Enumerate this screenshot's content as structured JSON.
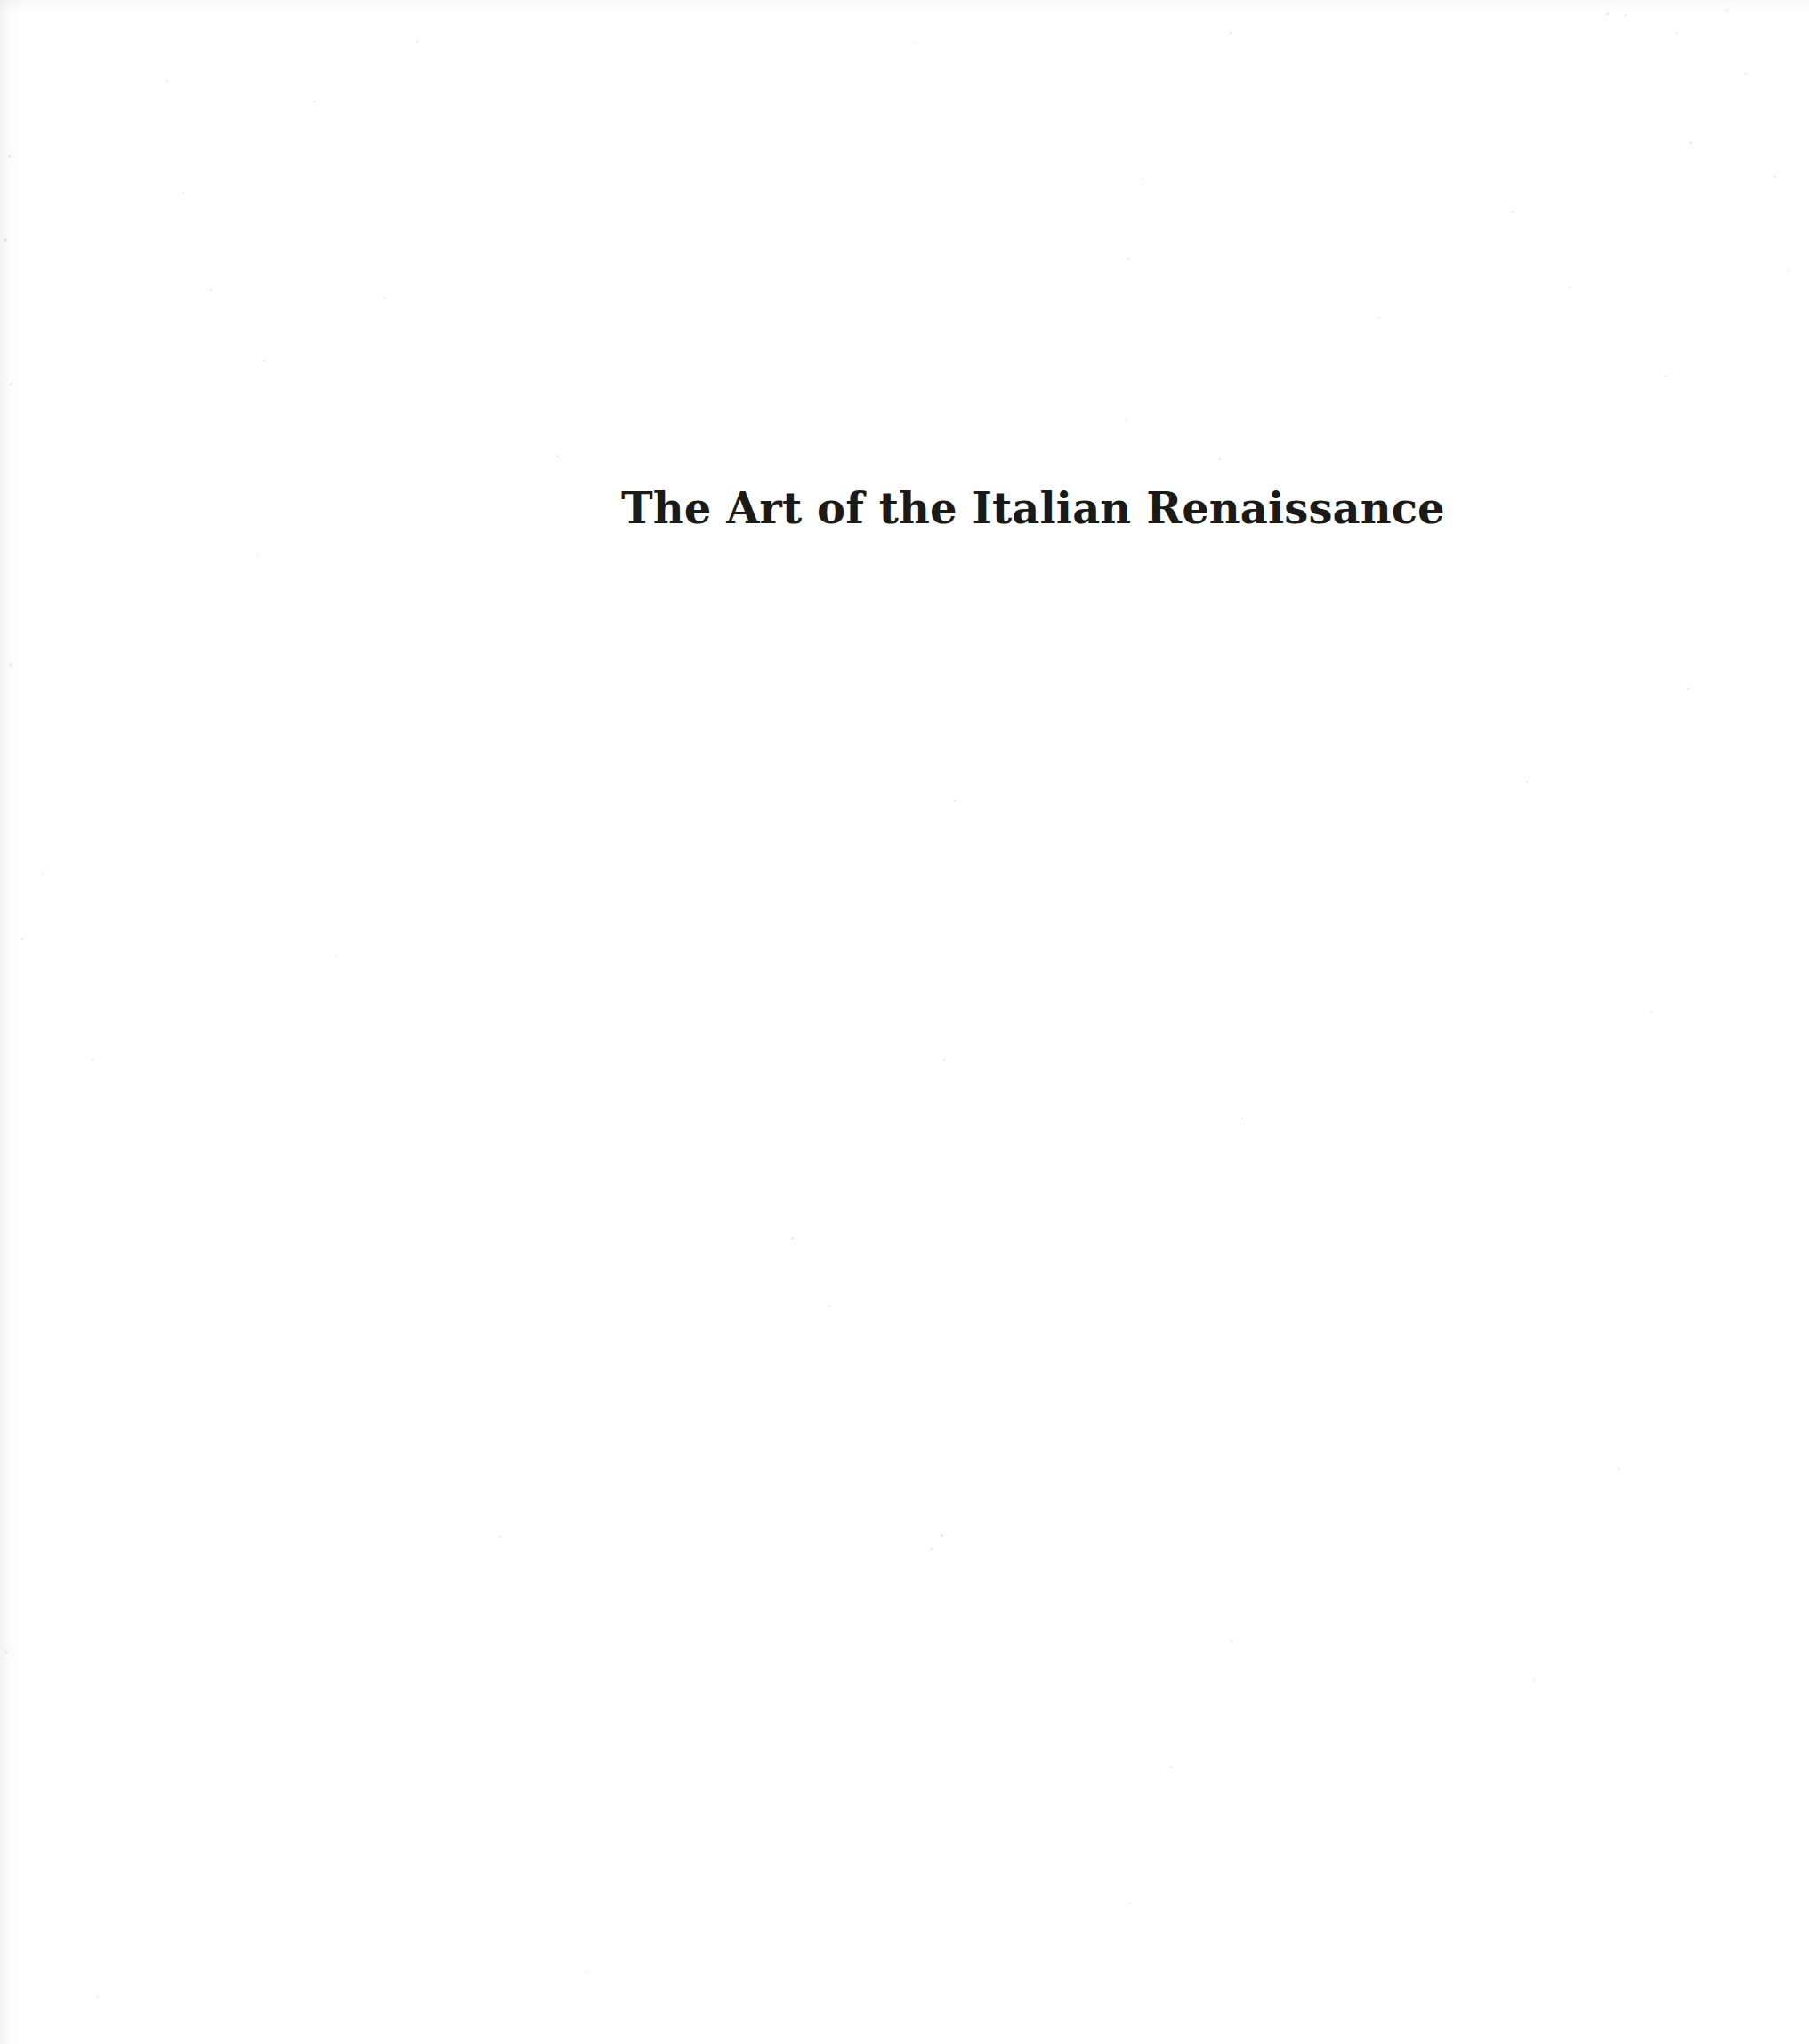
{
  "page": {
    "kind": "scanned-book-page",
    "background_color": "#ffffff",
    "width": 2033,
    "height": 2297
  },
  "title": {
    "text": "The Art of the Italian Renaissance",
    "color": "#1a1a18",
    "weight": "bold",
    "style": "serif"
  },
  "artifacts": {
    "speckle_color": "#c9c9c9",
    "gutter_side": "left",
    "specks": [
      {
        "x": 625,
        "y": 511,
        "size": 3
      },
      {
        "x": 1805,
        "y": 14,
        "size": 3
      },
      {
        "x": 1826,
        "y": 16,
        "size": 2
      },
      {
        "x": 1940,
        "y": 10,
        "size": 2
      },
      {
        "x": 352,
        "y": 113,
        "size": 2
      },
      {
        "x": 186,
        "y": 90,
        "size": 2
      },
      {
        "x": 468,
        "y": 46,
        "size": 2
      },
      {
        "x": 1382,
        "y": 36,
        "size": 2
      },
      {
        "x": 1026,
        "y": 47,
        "size": 2
      },
      {
        "x": 1883,
        "y": 36,
        "size": 2
      },
      {
        "x": 9,
        "y": 174,
        "size": 3
      },
      {
        "x": 4,
        "y": 268,
        "size": 4
      },
      {
        "x": 1961,
        "y": 82,
        "size": 2
      },
      {
        "x": 1283,
        "y": 200,
        "size": 2
      },
      {
        "x": 1994,
        "y": 198,
        "size": 2
      },
      {
        "x": 205,
        "y": 216,
        "size": 2
      },
      {
        "x": 236,
        "y": 325,
        "size": 2
      },
      {
        "x": 1763,
        "y": 322,
        "size": 2
      },
      {
        "x": 1899,
        "y": 159,
        "size": 3
      },
      {
        "x": 11,
        "y": 430,
        "size": 3
      },
      {
        "x": 1699,
        "y": 237,
        "size": 2
      },
      {
        "x": 2009,
        "y": 303,
        "size": 2
      },
      {
        "x": 296,
        "y": 404,
        "size": 2
      },
      {
        "x": 1264,
        "y": 471,
        "size": 2
      },
      {
        "x": 1549,
        "y": 356,
        "size": 2
      },
      {
        "x": 1267,
        "y": 290,
        "size": 2
      },
      {
        "x": 1871,
        "y": 422,
        "size": 2
      },
      {
        "x": 289,
        "y": 623,
        "size": 2
      },
      {
        "x": 431,
        "y": 334,
        "size": 2
      },
      {
        "x": 11,
        "y": 745,
        "size": 3
      },
      {
        "x": 1370,
        "y": 515,
        "size": 2
      },
      {
        "x": 47,
        "y": 981,
        "size": 2
      },
      {
        "x": 1072,
        "y": 899,
        "size": 2
      },
      {
        "x": 1896,
        "y": 773,
        "size": 2
      },
      {
        "x": 376,
        "y": 1074,
        "size": 2
      },
      {
        "x": 1715,
        "y": 878,
        "size": 2
      },
      {
        "x": 889,
        "y": 1390,
        "size": 3
      },
      {
        "x": 931,
        "y": 1467,
        "size": 2
      },
      {
        "x": 1395,
        "y": 1256,
        "size": 2
      },
      {
        "x": 103,
        "y": 1190,
        "size": 2
      },
      {
        "x": 24,
        "y": 1054,
        "size": 2
      },
      {
        "x": 561,
        "y": 1726,
        "size": 2
      },
      {
        "x": 1060,
        "y": 1190,
        "size": 2
      },
      {
        "x": 1855,
        "y": 1136,
        "size": 2
      },
      {
        "x": 1057,
        "y": 1724,
        "size": 3
      },
      {
        "x": 1315,
        "y": 1985,
        "size": 2
      },
      {
        "x": 1383,
        "y": 1843,
        "size": 2
      },
      {
        "x": 6,
        "y": 1855,
        "size": 3
      },
      {
        "x": 660,
        "y": 2215,
        "size": 2
      },
      {
        "x": 1269,
        "y": 2138,
        "size": 2
      },
      {
        "x": 109,
        "y": 2243,
        "size": 2
      },
      {
        "x": 1723,
        "y": 1887,
        "size": 2
      },
      {
        "x": 1046,
        "y": 1740,
        "size": 2
      },
      {
        "x": 1818,
        "y": 1650,
        "size": 2
      }
    ]
  }
}
